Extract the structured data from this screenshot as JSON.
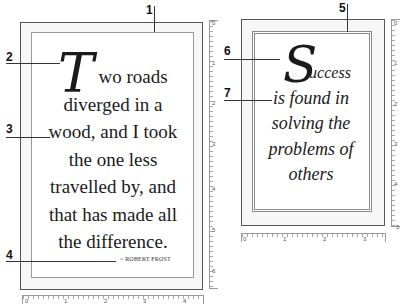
{
  "callouts": {
    "c1": "1",
    "c2": "2",
    "c3": "3",
    "c4": "4",
    "c5": "5",
    "c6": "6",
    "c7": "7"
  },
  "left_card": {
    "dropcap": "T",
    "lines": [
      "wo roads",
      "diverged in a",
      "wood, and I took",
      "the one less",
      "travelled by, and",
      "that has made all",
      "the difference."
    ],
    "author": "~ ROBERT FROST",
    "ruler_bottom": [
      "0",
      "1",
      "2",
      "3",
      "4"
    ],
    "ruler_right": [
      "0",
      "1",
      "2",
      "3",
      "4",
      "5",
      "6"
    ]
  },
  "right_card": {
    "dropcap": "S",
    "lines": [
      "uccess",
      "is found in",
      "solving the",
      "problems of",
      "others"
    ],
    "ruler_bottom": [
      "0",
      "1",
      "2",
      "3"
    ],
    "ruler_right": [
      "0",
      "1",
      "2",
      "3",
      "4",
      "5"
    ]
  },
  "colors": {
    "outer_border": "#555555",
    "inner_border": "#9a9a9a",
    "text": "#1a1a1a"
  }
}
